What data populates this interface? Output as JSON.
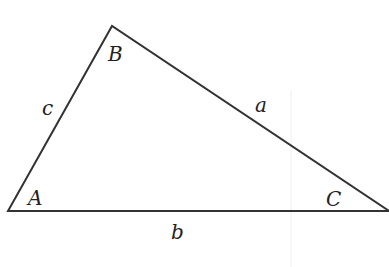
{
  "diagram": {
    "type": "triangle",
    "colors": {
      "stroke": "#333333",
      "text": "#222222",
      "background": "#ffffff"
    },
    "vertices": [
      {
        "name": "A",
        "x": 8,
        "y": 211
      },
      {
        "name": "B",
        "x": 112,
        "y": 26
      },
      {
        "name": "C",
        "x": 389,
        "y": 211
      }
    ],
    "angle_labels": {
      "A": "A",
      "B": "B",
      "C": "C"
    },
    "side_labels": {
      "a": "a",
      "b": "b",
      "c": "c"
    }
  }
}
